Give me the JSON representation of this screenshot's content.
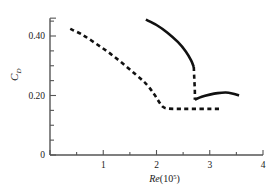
{
  "chart_data": {
    "type": "line",
    "title": "",
    "xlabel": "Re(10⁵)",
    "xlabel_base": "Re",
    "xlabel_paren_open": "(10",
    "xlabel_exponent": "5",
    "xlabel_paren_close": ")",
    "ylabel": "C_D",
    "ylabel_base": "C",
    "ylabel_sub": "D",
    "xlim": [
      0.0,
      4.0
    ],
    "ylim": [
      0.0,
      0.46
    ],
    "grid": false,
    "legend": "none",
    "xticks": [
      1,
      2,
      3,
      4
    ],
    "xtick_labels": [
      "1",
      "2",
      "3",
      "4"
    ],
    "xminor_step": 0.5,
    "yticks": [
      0,
      0.2,
      0.4
    ],
    "ytick_labels": [
      "0",
      "0.20",
      "0.40"
    ],
    "yminor_step": 0.05,
    "axis_color": "#555555",
    "curve_color": "#111111",
    "series": [
      {
        "name": "descending-dashed-branch",
        "style": "dashed",
        "points": [
          [
            0.38,
            0.424
          ],
          [
            0.6,
            0.405
          ],
          [
            0.85,
            0.376
          ],
          [
            1.1,
            0.345
          ],
          [
            1.35,
            0.31
          ],
          [
            1.6,
            0.272
          ],
          [
            1.8,
            0.24
          ],
          [
            1.95,
            0.206
          ],
          [
            2.05,
            0.178
          ],
          [
            2.12,
            0.162
          ],
          [
            2.22,
            0.156
          ],
          [
            2.45,
            0.155
          ],
          [
            2.7,
            0.155
          ],
          [
            3.0,
            0.155
          ],
          [
            3.22,
            0.155
          ]
        ]
      },
      {
        "name": "upper-solid-branch",
        "style": "solid",
        "points": [
          [
            1.8,
            0.455
          ],
          [
            2.0,
            0.437
          ],
          [
            2.2,
            0.412
          ],
          [
            2.4,
            0.38
          ],
          [
            2.55,
            0.348
          ],
          [
            2.65,
            0.318
          ],
          [
            2.7,
            0.296
          ]
        ]
      },
      {
        "name": "transition-drop-dashed",
        "style": "dashed",
        "points": [
          [
            2.7,
            0.296
          ],
          [
            2.71,
            0.255
          ],
          [
            2.72,
            0.215
          ],
          [
            2.72,
            0.186
          ]
        ]
      },
      {
        "name": "lower-solid-branch",
        "style": "solid",
        "points": [
          [
            2.72,
            0.186
          ],
          [
            2.85,
            0.196
          ],
          [
            3.0,
            0.203
          ],
          [
            3.15,
            0.208
          ],
          [
            3.3,
            0.21
          ],
          [
            3.42,
            0.207
          ],
          [
            3.55,
            0.2
          ]
        ]
      }
    ]
  }
}
